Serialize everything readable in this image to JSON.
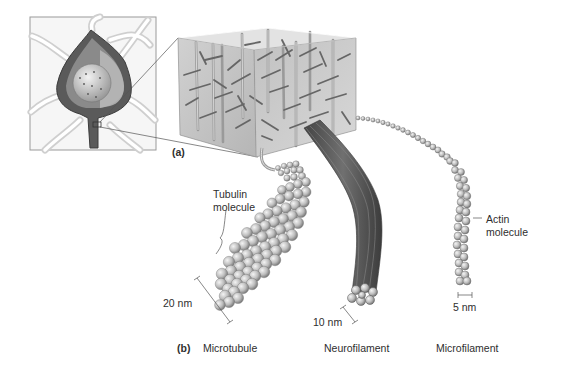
{
  "panel_a": {
    "label": "(a)",
    "inset": "neuron-cell-body-cutaway",
    "box": "cytoskeleton-3d-block"
  },
  "panel_b": {
    "label": "(b)",
    "filaments": [
      {
        "name": "Microtubule",
        "diameter": "20 nm",
        "subunit_label": [
          "Tubulin",
          "molecule"
        ]
      },
      {
        "name": "Neurofilament",
        "diameter": "10 nm"
      },
      {
        "name": "Microfilament",
        "diameter": "5 nm",
        "subunit_label": [
          "Actin",
          "molecule"
        ]
      }
    ]
  },
  "colors": {
    "background": "#ffffff",
    "box_face": "#bdbdbd",
    "sphere": "#c8c8c8",
    "neurofilament": "#5a5a5a",
    "text": "#2e2e2e"
  }
}
